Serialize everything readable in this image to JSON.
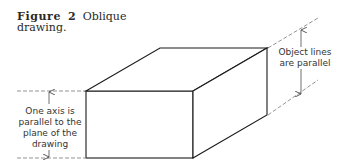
{
  "caption": {
    "figure_word": "Figure",
    "number": "2",
    "title_line1": "Oblique",
    "title_line2": "drawing."
  },
  "labels": {
    "left": "One axis is parallel to the plane of the drawing",
    "right": "Object lines are parallel"
  },
  "colors": {
    "line": "#1a1a1a",
    "dashed": "#555555",
    "text": "#333333"
  }
}
